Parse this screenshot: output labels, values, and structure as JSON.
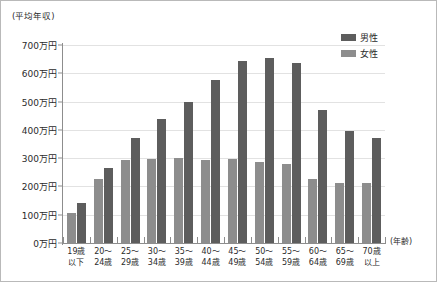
{
  "chart_data": {
    "type": "bar",
    "title": "",
    "subtitle": "",
    "ylabel": "(平均年収)",
    "xlabel": "(年齢)",
    "ylim": [
      0,
      700
    ],
    "ytick_step": 100,
    "ytick_labels": [
      "700万円",
      "600万円",
      "500万円",
      "400万円",
      "300万円",
      "200万円",
      "100万円",
      "0万円"
    ],
    "ytick_values": [
      700,
      600,
      500,
      400,
      300,
      200,
      100,
      0
    ],
    "grid": true,
    "legend_position": "top-right",
    "categories": [
      "19歳以下",
      "20〜24歳",
      "25〜29歳",
      "30〜34歳",
      "35〜39歳",
      "40〜44歳",
      "45〜49歳",
      "50〜54歳",
      "55〜59歳",
      "60〜64歳",
      "65〜69歳",
      "70歳以上"
    ],
    "category_lines": [
      [
        "19歳",
        "以下"
      ],
      [
        "20〜",
        "24歳"
      ],
      [
        "25〜",
        "29歳"
      ],
      [
        "30〜",
        "34歳"
      ],
      [
        "35〜",
        "39歳"
      ],
      [
        "40〜",
        "44歳"
      ],
      [
        "45〜",
        "49歳"
      ],
      [
        "50〜",
        "54歳"
      ],
      [
        "55〜",
        "59歳"
      ],
      [
        "60〜",
        "64歳"
      ],
      [
        "65〜",
        "69歳"
      ],
      [
        "70歳",
        "以上"
      ]
    ],
    "series": [
      {
        "name": "女性",
        "color": "#8d8d8d",
        "order": 0,
        "values": [
          105,
          225,
          295,
          296,
          299,
          292,
          297,
          285,
          279,
          226,
          212,
          211
        ]
      },
      {
        "name": "男性",
        "color": "#5d5d5d",
        "order": 1,
        "values": [
          140,
          265,
          370,
          440,
          500,
          575,
          645,
          655,
          637,
          469,
          396,
          372
        ]
      }
    ],
    "legend": [
      {
        "label": "男性",
        "color": "#5d5d5d"
      },
      {
        "label": "女性",
        "color": "#8d8d8d"
      }
    ]
  },
  "colors": {
    "male": "#5d5d5d",
    "female": "#8d8d8d",
    "axis": "#8d8d8d",
    "grid": "#e2e2e2",
    "text": "#2b2b2b",
    "border": "#b9b9b9",
    "background": "#ffffff"
  }
}
